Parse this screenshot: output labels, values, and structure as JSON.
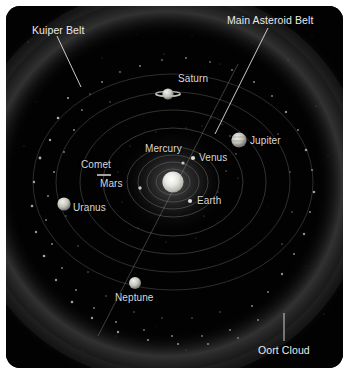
{
  "diagram": {
    "background_color": "#000000",
    "frame_color": "#ffffff",
    "label_color": "#d8d8d8",
    "sun_color": "#d9d9d4",
    "orbit_color": "#6a6a6a"
  },
  "callouts": [
    {
      "id": "kuiper-belt",
      "label": "Kuiper Belt",
      "x": 32,
      "y": 24,
      "line": {
        "x1": 57,
        "y1": 36,
        "x2": 79,
        "y2": 85
      }
    },
    {
      "id": "main-asteroid-belt",
      "label": "Main Asteroid Belt",
      "x": 227,
      "y": 14,
      "line": {
        "x1": 266,
        "y1": 26,
        "x2": 213,
        "y2": 131
      }
    },
    {
      "id": "oort-cloud",
      "label": "Oort Cloud",
      "x": 258,
      "y": 344,
      "line": {
        "x1": 282,
        "y1": 312,
        "x2": 282,
        "y2": 338
      }
    }
  ],
  "bodies": [
    {
      "id": "sun",
      "label": "",
      "cx": 173,
      "cy": 182,
      "r": 10.5,
      "type": "sun"
    },
    {
      "id": "mercury",
      "label": "Mercury",
      "cx": 183,
      "cy": 163,
      "r": 1.6,
      "type": "dot",
      "label_x": 145,
      "label_y": 143
    },
    {
      "id": "venus",
      "label": "Venus",
      "cx": 193,
      "cy": 158,
      "r": 2.0,
      "type": "dot",
      "label_x": 199,
      "label_y": 152
    },
    {
      "id": "earth",
      "label": "Earth",
      "cx": 190,
      "cy": 201,
      "r": 2.0,
      "type": "dot",
      "label_x": 197,
      "label_y": 195
    },
    {
      "id": "mars",
      "label": "Mars",
      "cx": 140,
      "cy": 188,
      "r": 1.7,
      "type": "dot",
      "label_x": 100,
      "label_y": 178
    },
    {
      "id": "jupiter",
      "label": "Jupiter",
      "cx": 239,
      "cy": 140,
      "r": 7.5,
      "type": "banded",
      "label_x": 250,
      "label_y": 135
    },
    {
      "id": "saturn",
      "label": "Saturn",
      "cx": 168,
      "cy": 94,
      "r": 6.0,
      "type": "ringed",
      "label_x": 178,
      "label_y": 73
    },
    {
      "id": "uranus",
      "label": "Uranus",
      "cx": 64,
      "cy": 204,
      "r": 6.5,
      "type": "sphere",
      "label_x": 73,
      "label_y": 202
    },
    {
      "id": "neptune",
      "label": "Neptune",
      "cx": 135,
      "cy": 283,
      "r": 6.0,
      "type": "sphere",
      "label_x": 115,
      "label_y": 292
    },
    {
      "id": "comet",
      "label": "Comet",
      "cx": 103,
      "cy": 174,
      "r": 0,
      "type": "comet",
      "label_x": 81,
      "label_y": 159
    }
  ],
  "orbits": [
    {
      "id": "orbit-mercury",
      "rx": 17,
      "ry": 13
    },
    {
      "id": "orbit-venus",
      "rx": 26,
      "ry": 20
    },
    {
      "id": "orbit-earth",
      "rx": 35,
      "ry": 27
    },
    {
      "id": "orbit-mars",
      "rx": 46,
      "ry": 35
    },
    {
      "id": "orbit-jupiter",
      "rx": 70,
      "ry": 54
    },
    {
      "id": "orbit-saturn",
      "rx": 93,
      "ry": 72
    },
    {
      "id": "orbit-uranus",
      "rx": 117,
      "ry": 90
    },
    {
      "id": "orbit-neptune",
      "rx": 140,
      "ry": 108
    }
  ],
  "regions": [
    {
      "id": "main-asteroid-belt-band",
      "between": "Mars and Jupiter"
    },
    {
      "id": "kuiper-belt-band",
      "beyond": "Neptune"
    },
    {
      "id": "oort-cloud-halo",
      "outermost": "spherical shell"
    }
  ]
}
